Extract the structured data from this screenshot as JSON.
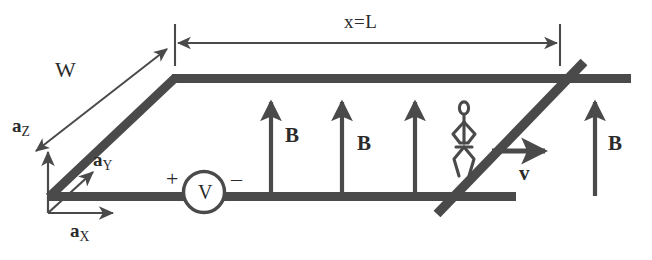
{
  "figure": {
    "type": "physics-diagram",
    "ink_color": "#4a4a4a",
    "text_color": "#2b2b2b",
    "background_color": "#ffffff"
  },
  "dimensions": {
    "length": {
      "label": "x=L",
      "style": "double-headed-arrow",
      "position": "top"
    },
    "width": {
      "label": "W",
      "style": "double-headed-arrow",
      "position": "left-diagonal"
    }
  },
  "axes": {
    "x": {
      "symbol": "a",
      "subscript": "X",
      "direction": "right"
    },
    "y": {
      "symbol": "a",
      "subscript": "Y",
      "direction": "up-right-diagonal"
    },
    "z": {
      "symbol": "a",
      "subscript": "Z",
      "direction": "up"
    }
  },
  "source": {
    "symbol": "V",
    "plus_terminal": "+",
    "minus_terminal": "–",
    "shape": "circle"
  },
  "field": {
    "symbol": "B",
    "direction": "up",
    "arrow_count": 4,
    "labels": [
      "B",
      "B",
      "B",
      "B"
    ]
  },
  "slider": {
    "velocity_symbol": "v",
    "velocity_direction": "right",
    "rider": "stick-figure"
  }
}
